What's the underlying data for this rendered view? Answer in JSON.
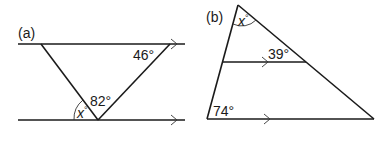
{
  "diagram_a": {
    "label": "(a)",
    "angles": {
      "top_right": "46°",
      "bottom_apex": "82°",
      "unknown_var": "x",
      "degree": "°"
    },
    "description": "Triangle between two parallel lines; find x"
  },
  "diagram_b": {
    "label": "(b)",
    "angles": {
      "apex_var": "x",
      "degree": "°",
      "middle_line": "39°",
      "bottom_left": "74°"
    },
    "description": "Triangle with a line parallel to its base; find x"
  },
  "colors": {
    "stroke": "#1a1a1a",
    "background": "#ffffff"
  }
}
